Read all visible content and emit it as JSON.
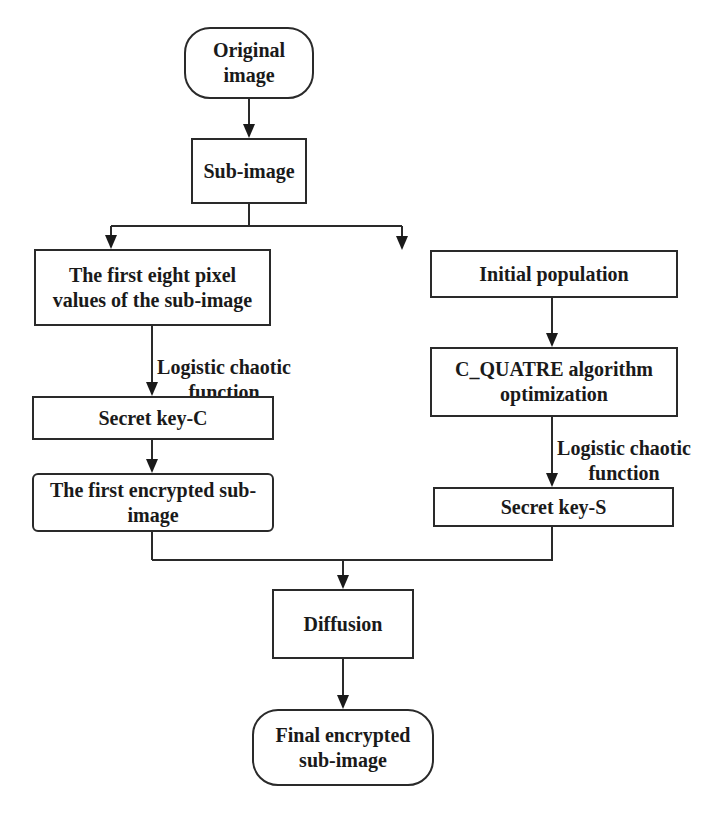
{
  "diagram": {
    "type": "flowchart",
    "nodes": {
      "start": {
        "label": "Original image",
        "shape": "terminal"
      },
      "subimage": {
        "label": "Sub-image",
        "shape": "process"
      },
      "left_pixels": {
        "label": "The first eight pixel values of the sub-image",
        "shape": "process"
      },
      "left_key": {
        "label": "Secret key-C",
        "shape": "process"
      },
      "left_encrypted": {
        "label": "The first encrypted sub-image",
        "shape": "process"
      },
      "right_population": {
        "label": "Initial population",
        "shape": "process"
      },
      "right_optimization": {
        "label": "C_QUATRE algorithm optimization",
        "shape": "process"
      },
      "right_key": {
        "label": "Secret key-S",
        "shape": "process"
      },
      "diffusion": {
        "label": "Diffusion",
        "shape": "process"
      },
      "end": {
        "label": "Final encrypted sub-image",
        "shape": "terminal"
      }
    },
    "edge_labels": {
      "left_logistic": "Logistic chaotic function",
      "right_logistic": "Logistic chaotic function"
    },
    "edges": [
      {
        "from": "start",
        "to": "subimage"
      },
      {
        "from": "subimage",
        "to": "left_pixels"
      },
      {
        "from": "subimage",
        "to": "right_population"
      },
      {
        "from": "left_pixels",
        "to": "left_key",
        "label": "Logistic chaotic function"
      },
      {
        "from": "left_key",
        "to": "left_encrypted"
      },
      {
        "from": "right_population",
        "to": "right_optimization"
      },
      {
        "from": "right_optimization",
        "to": "right_key",
        "label": "Logistic chaotic function"
      },
      {
        "from": "left_encrypted",
        "to": "diffusion"
      },
      {
        "from": "right_key",
        "to": "diffusion"
      },
      {
        "from": "diffusion",
        "to": "end"
      }
    ],
    "colors": {
      "stroke": "#2a2a2a",
      "background": "#ffffff",
      "text": "#1a1a1a"
    }
  }
}
